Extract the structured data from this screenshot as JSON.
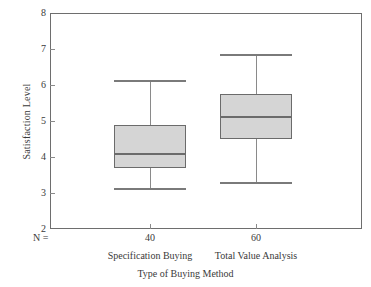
{
  "chart_data": {
    "type": "box",
    "title": "",
    "xlabel": "Type of Buying Method",
    "ylabel": "Satisfaction Level",
    "ylim": [
      2,
      8
    ],
    "yticks": [
      2,
      3,
      4,
      5,
      6,
      7,
      8
    ],
    "ytick_labels": [
      "2",
      "3",
      "4",
      "5",
      "6",
      "7",
      "8"
    ],
    "grid": false,
    "legend": "none",
    "n_row_label": "N =",
    "categories": [
      "Specification Buying",
      "Total Value Analysis"
    ],
    "n_values": [
      "40",
      "60"
    ],
    "boxes": [
      {
        "category": "Specification Buying",
        "n": "40",
        "whisker_low": 3.15,
        "q1": 3.7,
        "median": 4.08,
        "q3": 4.9,
        "whisker_high": 6.15
      },
      {
        "category": "Total Value Analysis",
        "n": "60",
        "whisker_low": 3.3,
        "q1": 4.5,
        "median": 5.1,
        "q3": 5.75,
        "whisker_high": 6.85
      }
    ],
    "colors": {
      "box_fill": "#d5d5d5",
      "box_edge": "#6b6b6b",
      "median": "#6b6b6b",
      "whisker": "#8a8a8a",
      "frame": "#6e6e6e",
      "text": "#3a3a3a",
      "background": "#ffffff"
    }
  }
}
